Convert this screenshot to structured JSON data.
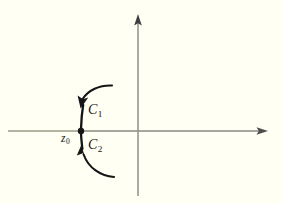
{
  "figure": {
    "kind": "complex-plane-contour-diagram",
    "background_color": "#fffff4",
    "width": 283,
    "height": 204
  },
  "axes": {
    "real_axis": {
      "name": "horizontal-axis",
      "color": "#8a8a7a",
      "left_segment_color": "#9b9b86",
      "y": 131,
      "x_start": 8,
      "x_end": 268,
      "arrow_at": "right"
    },
    "imaginary_axis": {
      "name": "vertical-axis",
      "color": "#8f8f8f",
      "x": 138,
      "y_start": 14,
      "y_end": 196,
      "arrow_at": "top"
    }
  },
  "point": {
    "label": "z",
    "subscript": "0",
    "x": 81,
    "y": 131,
    "radius": 3.2,
    "color": "#151515"
  },
  "arcs": [
    {
      "id": "C1",
      "label": "C",
      "subscript": "1",
      "position": "upper",
      "direction": "toward-point",
      "color": "#151515",
      "arrow_tip": {
        "x": 80.5,
        "y": 106
      },
      "far_end": {
        "x": 112,
        "y": 85
      }
    },
    {
      "id": "C2",
      "label": "C",
      "subscript": "2",
      "position": "lower",
      "direction": "toward-point",
      "color": "#151515",
      "arrow_tip": {
        "x": 82,
        "y": 147
      },
      "far_end": {
        "x": 114,
        "y": 177
      }
    }
  ],
  "colors": {
    "ink": "#151515",
    "axis_gray": "#8f8f8f",
    "axis_olive": "#9b9b86",
    "paper": "#fffff4"
  }
}
